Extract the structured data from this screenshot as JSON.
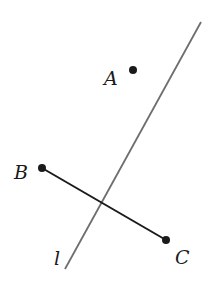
{
  "figure": {
    "line": {
      "label": "l",
      "color": "#6e6e6e"
    },
    "segment": {
      "color": "#1a1a1a"
    },
    "points": [
      {
        "name": "A",
        "label": "A"
      },
      {
        "name": "B",
        "label": "B"
      },
      {
        "name": "C",
        "label": "C"
      }
    ]
  }
}
